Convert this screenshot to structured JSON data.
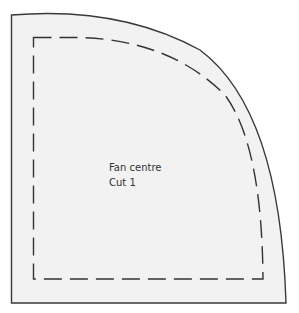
{
  "pattern": {
    "name_label": "Fan centre",
    "cut_label": "Cut 1",
    "colors": {
      "fill": "#f2f2f2",
      "outline": "#3a3a3a",
      "seam_line": "#333333"
    }
  }
}
